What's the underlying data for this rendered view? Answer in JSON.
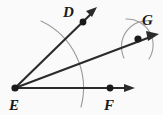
{
  "figure": {
    "background_color": "#fafafa",
    "ink_color": "#2b2b2b",
    "arc_color": "#8c8c8c",
    "width": 163,
    "height": 115
  },
  "labels": {
    "vertex_e": "E",
    "point_d": "D",
    "point_f": "F",
    "point_g": "G"
  },
  "points": {
    "E": {
      "x": 15,
      "y": 88,
      "label_x": 11,
      "label_y": 108
    },
    "D": {
      "x": 83,
      "y": 22,
      "label_x": 64,
      "label_y": 16
    },
    "F": {
      "x": 110,
      "y": 88,
      "label_x": 105,
      "label_y": 108
    },
    "G": {
      "x": 138,
      "y": 39,
      "label_x": 143,
      "label_y": 24
    }
  },
  "rays": {
    "ED": {
      "from": "E",
      "through": "D",
      "tip_x": 97,
      "tip_y": 8
    },
    "EG": {
      "from": "E",
      "through": "G",
      "tip_x": 158,
      "tip_y": 35
    },
    "EF": {
      "from": "E",
      "through": "F",
      "tip_x": 134,
      "tip_y": 88
    }
  },
  "construction_arcs": {
    "main_sweep": {
      "start_x": 41,
      "start_y": 21,
      "end_x": 81,
      "end_y": 107,
      "radius": 72
    },
    "cross_arc_one": {
      "start_x": 126,
      "start_y": 20,
      "end_x": 148,
      "end_y": 58
    },
    "cross_arc_two": {
      "start_x": 150,
      "start_y": 22,
      "end_x": 125,
      "end_y": 58
    }
  }
}
